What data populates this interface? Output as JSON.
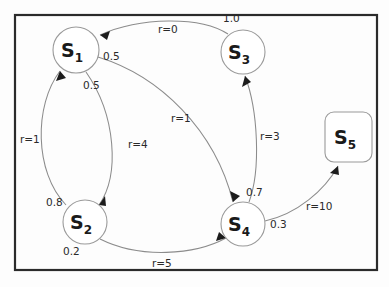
{
  "diagram": {
    "frame": {
      "color": "#2b2b2b"
    },
    "node_stroke": "#9a9a9a",
    "edge_color": "#8c8c8c",
    "text_color": "#2a2a2a",
    "nodes": [
      {
        "id": "S1",
        "label": "S",
        "sub": "1",
        "shape": "circle",
        "cx": 76,
        "cy": 50,
        "r": 23
      },
      {
        "id": "S2",
        "label": "S",
        "sub": "2",
        "shape": "circle",
        "cx": 85,
        "cy": 222,
        "r": 22
      },
      {
        "id": "S3",
        "label": "S",
        "sub": "3",
        "shape": "circle",
        "cx": 243,
        "cy": 52,
        "r": 22
      },
      {
        "id": "S4",
        "label": "S",
        "sub": "4",
        "shape": "circle",
        "cx": 243,
        "cy": 224,
        "r": 22
      },
      {
        "id": "S5",
        "label": "S",
        "sub": "5",
        "shape": "rounded-rect",
        "cx": 349,
        "cy": 137,
        "w": 47,
        "h": 50
      }
    ],
    "probability_labels": [
      {
        "name": "prob-s3-to-s1",
        "text": "1.0",
        "x": 223,
        "y": 22
      },
      {
        "name": "prob-s1-to-s4",
        "text": "0.5",
        "x": 103,
        "y": 60
      },
      {
        "name": "prob-s1-to-s2",
        "text": "0.5",
        "x": 83,
        "y": 89
      },
      {
        "name": "prob-s2-to-s1",
        "text": "0.8",
        "x": 46,
        "y": 206
      },
      {
        "name": "prob-s2-to-s4",
        "text": "0.2",
        "x": 63,
        "y": 255
      },
      {
        "name": "prob-s4-to-s3",
        "text": "0.7",
        "x": 246,
        "y": 196
      },
      {
        "name": "prob-s4-to-s5",
        "text": "0.3",
        "x": 270,
        "y": 228
      }
    ],
    "reward_labels": [
      {
        "name": "reward-s3-to-s1",
        "text": "r=0",
        "x": 158,
        "y": 33
      },
      {
        "name": "reward-s2-to-s1",
        "text": "r=1",
        "x": 20,
        "y": 143
      },
      {
        "name": "reward-s1-to-s2",
        "text": "r=4",
        "x": 128,
        "y": 148
      },
      {
        "name": "reward-s1-to-s4",
        "text": "r=1",
        "x": 171,
        "y": 122
      },
      {
        "name": "reward-s4-to-s3",
        "text": "r=3",
        "x": 260,
        "y": 140
      },
      {
        "name": "reward-s4-to-s5",
        "text": "r=10",
        "x": 306,
        "y": 210
      },
      {
        "name": "reward-s2-to-s4",
        "text": "r=5",
        "x": 152,
        "y": 267
      }
    ],
    "transitions": [
      {
        "name": "edge-s3-to-s1",
        "from": "S3",
        "to": "S1",
        "probability": "1.0",
        "reward": "r=0"
      },
      {
        "name": "edge-s1-to-s2",
        "from": "S1",
        "to": "S2",
        "probability": "0.5",
        "reward": "r=4"
      },
      {
        "name": "edge-s1-to-s4",
        "from": "S1",
        "to": "S4",
        "probability": "0.5",
        "reward": "r=1"
      },
      {
        "name": "edge-s2-to-s1",
        "from": "S2",
        "to": "S1",
        "probability": "0.8",
        "reward": "r=1"
      },
      {
        "name": "edge-s2-to-s4",
        "from": "S2",
        "to": "S4",
        "probability": "0.2",
        "reward": "r=5"
      },
      {
        "name": "edge-s4-to-s3",
        "from": "S4",
        "to": "S3",
        "probability": "0.7",
        "reward": "r=3"
      },
      {
        "name": "edge-s4-to-s5",
        "from": "S4",
        "to": "S5",
        "probability": "0.3",
        "reward": "r=10"
      }
    ]
  }
}
